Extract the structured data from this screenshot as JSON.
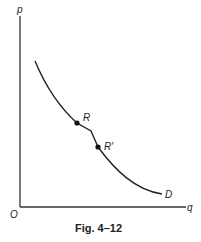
{
  "figure": {
    "caption": "Fig. 4–12",
    "axes": {
      "y_label": "p",
      "x_label": "q",
      "origin_label": "O"
    },
    "curve": {
      "label": "D",
      "points": [
        {
          "label": "R"
        },
        {
          "label": "R′"
        }
      ]
    }
  }
}
